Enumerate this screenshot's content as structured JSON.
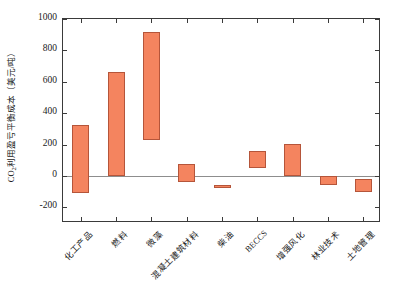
{
  "chart_data": {
    "type": "bar",
    "title": "",
    "xlabel": "",
    "ylabel": "CO2利用盈亏平衡成本（美元/吨）",
    "ylabel_prefix": "CO",
    "ylabel_sub": "2",
    "ylabel_suffix": "利用盈亏平衡成本（美元/吨）",
    "ylim": [
      -300,
      1000
    ],
    "ytick_labels": [
      "1000",
      "800",
      "600",
      "400",
      "200",
      "0",
      "-200"
    ],
    "ytick_values": [
      1000,
      800,
      600,
      400,
      200,
      0,
      -200
    ],
    "minor_ticks": true,
    "grid": false,
    "legend": "none",
    "bar_style": "floating-range",
    "bar_fill": "#f4845f",
    "bar_edge": "#b5553a",
    "zero_line_color": "#8d8d8d",
    "categories": [
      "化工产品",
      "燃料",
      "微藻",
      "混凝土建筑材料",
      "柴油",
      "BECCS",
      "增强风化",
      "林业技术",
      "土地管理"
    ],
    "low": [
      -110,
      0,
      230,
      -40,
      -80,
      50,
      0,
      -55,
      -100
    ],
    "high": [
      325,
      660,
      916,
      75,
      -55,
      160,
      205,
      0,
      -20
    ],
    "units": "美元/吨"
  }
}
